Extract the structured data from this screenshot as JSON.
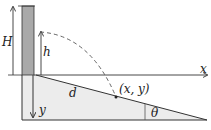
{
  "diagram": {
    "labels": {
      "H": "H",
      "h": "h",
      "x": "x",
      "y": "y",
      "d": "d",
      "point": "(x, y)",
      "theta": "θ"
    },
    "colors": {
      "wall": "#a9a9a9",
      "ground": "#ececec",
      "line": "#333333",
      "trajectory": "#555555"
    }
  }
}
